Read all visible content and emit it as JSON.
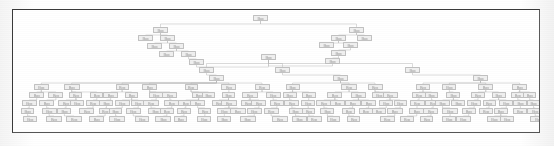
{
  "document": {
    "kind": "scanned-figure",
    "caption": "",
    "frame": {
      "border_color": "#3a3a3a",
      "background_color": "#ffffff",
      "x": 12,
      "y": 9,
      "width": 528,
      "height": 124
    },
    "page_background_color": "#fdfdfd"
  },
  "diagram": {
    "type": "hierarchical-tree",
    "orientation": "top-down",
    "node_box_color": "#f0f0f0",
    "node_border_color": "#c2c2c2",
    "node_text_color": "#8e8e8e",
    "edge_color": "#b9b9b9",
    "label_text": "Box",
    "node_count": 214,
    "depth_levels": 12,
    "nodes": [
      {
        "id": "n0",
        "x": 240,
        "y": 5,
        "w": 15,
        "h": 6,
        "level": 0
      },
      {
        "id": "n1",
        "x": 140,
        "y": 17,
        "w": 15,
        "h": 6,
        "level": 1
      },
      {
        "id": "n2",
        "x": 125,
        "y": 25,
        "w": 15,
        "h": 6,
        "level": 2
      },
      {
        "id": "n3",
        "x": 147,
        "y": 25,
        "w": 15,
        "h": 6,
        "level": 2
      },
      {
        "id": "n4",
        "x": 134,
        "y": 33,
        "w": 15,
        "h": 6,
        "level": 3
      },
      {
        "id": "n5",
        "x": 156,
        "y": 33,
        "w": 15,
        "h": 6,
        "level": 3
      },
      {
        "id": "n6",
        "x": 146,
        "y": 41,
        "w": 15,
        "h": 6,
        "level": 4
      },
      {
        "id": "n7",
        "x": 168,
        "y": 41,
        "w": 15,
        "h": 6,
        "level": 4
      },
      {
        "id": "n8",
        "x": 176,
        "y": 49,
        "w": 15,
        "h": 6,
        "level": 5
      },
      {
        "id": "n9",
        "x": 336,
        "y": 17,
        "w": 15,
        "h": 6,
        "level": 1
      },
      {
        "id": "n10",
        "x": 318,
        "y": 25,
        "w": 15,
        "h": 6,
        "level": 2
      },
      {
        "id": "n11",
        "x": 344,
        "y": 25,
        "w": 15,
        "h": 6,
        "level": 2
      },
      {
        "id": "n12",
        "x": 306,
        "y": 32,
        "w": 15,
        "h": 6,
        "level": 3
      },
      {
        "id": "n13",
        "x": 330,
        "y": 32,
        "w": 15,
        "h": 6,
        "level": 3
      },
      {
        "id": "n14",
        "x": 318,
        "y": 40,
        "w": 15,
        "h": 6,
        "level": 4
      },
      {
        "id": "n15",
        "x": 312,
        "y": 48,
        "w": 15,
        "h": 6,
        "level": 5
      },
      {
        "id": "n16",
        "x": 248,
        "y": 44,
        "w": 15,
        "h": 6,
        "level": 5
      },
      {
        "id": "n17",
        "x": 186,
        "y": 57,
        "w": 15,
        "h": 6,
        "level": 6
      },
      {
        "id": "n18",
        "x": 262,
        "y": 57,
        "w": 15,
        "h": 6,
        "level": 6
      },
      {
        "id": "n19",
        "x": 392,
        "y": 57,
        "w": 15,
        "h": 6,
        "level": 6
      },
      {
        "id": "n20",
        "x": 196,
        "y": 65,
        "w": 15,
        "h": 6,
        "level": 7
      },
      {
        "id": "n21",
        "x": 320,
        "y": 65,
        "w": 15,
        "h": 6,
        "level": 7
      },
      {
        "id": "n22",
        "x": 460,
        "y": 65,
        "w": 15,
        "h": 6,
        "level": 7
      }
    ],
    "generated_rows": [
      {
        "level": 8,
        "y": 74,
        "count": 14
      },
      {
        "level": 9,
        "y": 82,
        "count": 26
      },
      {
        "level": 10,
        "y": 90,
        "count": 34
      },
      {
        "level": 11,
        "y": 98,
        "count": 30
      },
      {
        "level": 12,
        "y": 106,
        "count": 24
      }
    ]
  }
}
